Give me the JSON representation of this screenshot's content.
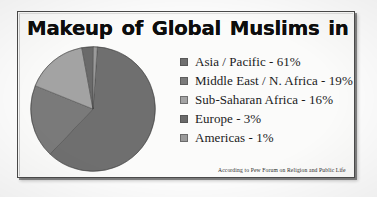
{
  "chart_data": {
    "type": "pie",
    "title": "Makeup of Global Muslims in 2010",
    "categories": [
      "Asia / Pacific",
      "Middle East / N. Africa",
      "Sub-Saharan Africa",
      "Europe",
      "Americas"
    ],
    "values": [
      61,
      19,
      16,
      3,
      1
    ],
    "value_unit": "%",
    "legend_position": "right",
    "grid": false,
    "legend_entries": [
      {
        "label": "Asia / Pacific  -  61%",
        "name": "Asia / Pacific",
        "value": 61,
        "color": "#6f6f6f"
      },
      {
        "label": "Middle East / N. Africa - 19%",
        "name": "Middle East / N. Africa",
        "value": 19,
        "color": "#7a7a7a"
      },
      {
        "label": "Sub-Saharan Africa  -  16%",
        "name": "Sub-Saharan Africa",
        "value": 16,
        "color": "#a3a3a3"
      },
      {
        "label": "Europe  -  3%",
        "name": "Europe",
        "value": 3,
        "color": "#6a6a6a"
      },
      {
        "label": "Americas  -  1%",
        "name": "Americas",
        "value": 1,
        "color": "#9a9a9a"
      }
    ],
    "source_note": "According to Pew Forum on Religion and Public Life"
  },
  "attribution": "According to Pew Forum on Religion and Public Life",
  "colors": {
    "asia_pacific": "#6f6f6f",
    "middle_east_n_africa": "#7a7a7a",
    "sub_saharan_africa": "#a3a3a3",
    "europe": "#6a6a6a",
    "americas": "#9a9a9a",
    "frame_border": "#4a4a4a",
    "title_text": "#0d0d0d",
    "page_background": "#fdfdfd"
  }
}
